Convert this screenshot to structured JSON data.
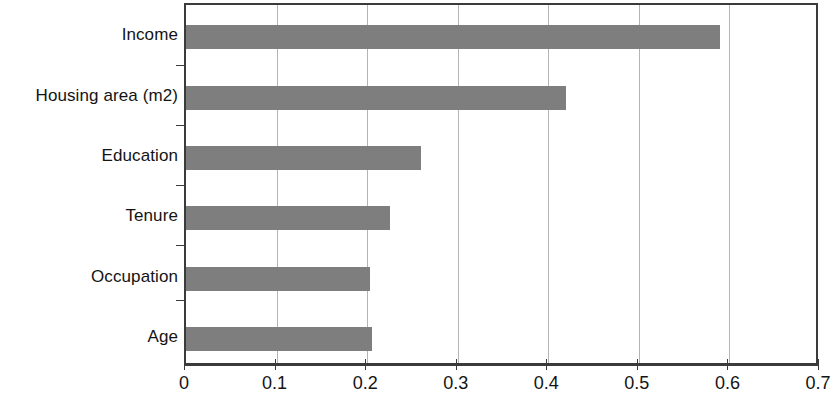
{
  "chart_data": {
    "type": "bar",
    "orientation": "horizontal",
    "title": "",
    "subtitle": "",
    "xlabel": "",
    "ylabel": "",
    "categories": [
      "Income",
      "Housing area (m2)",
      "Education",
      "Tenure",
      "Occupation",
      "Age"
    ],
    "values": [
      0.59,
      0.42,
      0.26,
      0.225,
      0.203,
      0.205
    ],
    "xlim": [
      0,
      0.7
    ],
    "ylim": null,
    "xticks": [
      0,
      0.1,
      0.2,
      0.3,
      0.4,
      0.5,
      0.6,
      0.7
    ],
    "xtick_labels": [
      "0",
      "0.1",
      "0.2",
      "0.3",
      "0.4",
      "0.5",
      "0.6",
      "0.7"
    ],
    "grid": "vertical",
    "legend": null,
    "legend_position": "none",
    "annotations": [],
    "series": [
      {
        "name": "",
        "values": [
          0.59,
          0.42,
          0.26,
          0.225,
          0.203,
          0.205
        ]
      }
    ],
    "colors": {
      "bar_fill": "#7e7e7e",
      "gridline": "#b4b4b4",
      "axis": "#3b3b3b",
      "text": "#141414",
      "background": "#ffffff"
    }
  }
}
